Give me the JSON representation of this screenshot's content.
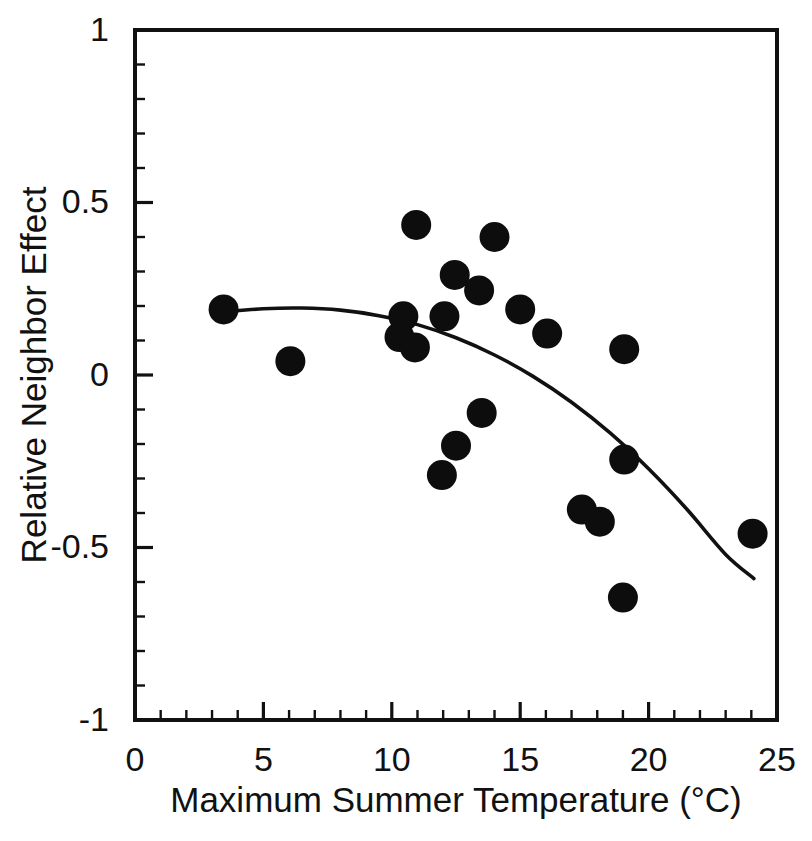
{
  "chart_data": {
    "type": "scatter",
    "title": "",
    "xlabel": "Maximum Summer Temperature (°C)",
    "ylabel": "Relative Neighbor Effect",
    "xlim": [
      0,
      25
    ],
    "ylim": [
      -1,
      1
    ],
    "grid": false,
    "legend": "none",
    "x_ticks_major": [
      0,
      5,
      10,
      15,
      20,
      25
    ],
    "x_tick_labels": [
      "0",
      "5",
      "10",
      "15",
      "20",
      "25"
    ],
    "x_tick_minor_step": 1,
    "y_ticks_major": [
      -1,
      -0.5,
      0,
      0.5,
      1
    ],
    "y_tick_labels": [
      "-1",
      "-0.5",
      "0",
      "0.5",
      "1"
    ],
    "y_tick_minor_step": 0.1,
    "marker": "filled-circle",
    "marker_color": "#0d0d0d",
    "marker_radius_px": 15,
    "points": [
      {
        "x": 3.45,
        "y": 0.19
      },
      {
        "x": 6.05,
        "y": 0.04
      },
      {
        "x": 10.45,
        "y": 0.17
      },
      {
        "x": 10.3,
        "y": 0.11
      },
      {
        "x": 10.9,
        "y": 0.08
      },
      {
        "x": 10.95,
        "y": 0.435
      },
      {
        "x": 12.05,
        "y": 0.17
      },
      {
        "x": 12.45,
        "y": 0.29
      },
      {
        "x": 13.4,
        "y": 0.245
      },
      {
        "x": 14.0,
        "y": 0.4
      },
      {
        "x": 15.0,
        "y": 0.19
      },
      {
        "x": 16.05,
        "y": 0.12
      },
      {
        "x": 19.05,
        "y": 0.075
      },
      {
        "x": 13.5,
        "y": -0.11
      },
      {
        "x": 12.5,
        "y": -0.205
      },
      {
        "x": 11.95,
        "y": -0.29
      },
      {
        "x": 19.05,
        "y": -0.245
      },
      {
        "x": 17.4,
        "y": -0.39
      },
      {
        "x": 18.1,
        "y": -0.425
      },
      {
        "x": 24.05,
        "y": -0.46
      },
      {
        "x": 19.0,
        "y": -0.645
      }
    ],
    "fit_curve": {
      "name": "quadratic-fit",
      "style": "solid",
      "color": "#111111",
      "x_start": 3.5,
      "x_end": 24.1,
      "points": [
        {
          "x": 3.5,
          "y": 0.183
        },
        {
          "x": 5.0,
          "y": 0.192
        },
        {
          "x": 6.5,
          "y": 0.194
        },
        {
          "x": 8.0,
          "y": 0.188
        },
        {
          "x": 9.5,
          "y": 0.172
        },
        {
          "x": 11.0,
          "y": 0.146
        },
        {
          "x": 12.5,
          "y": 0.108
        },
        {
          "x": 14.0,
          "y": 0.058
        },
        {
          "x": 15.5,
          "y": -0.004
        },
        {
          "x": 17.0,
          "y": -0.079
        },
        {
          "x": 18.5,
          "y": -0.168
        },
        {
          "x": 20.0,
          "y": -0.272
        },
        {
          "x": 21.5,
          "y": -0.39
        },
        {
          "x": 23.0,
          "y": -0.52
        },
        {
          "x": 24.1,
          "y": -0.59
        }
      ]
    }
  },
  "axes": {
    "x_title": "Maximum Summer Temperature (°C)",
    "y_title": "Relative Neighbor Effect",
    "x_labels": [
      "0",
      "5",
      "10",
      "15",
      "20",
      "25"
    ],
    "y_labels": [
      "1",
      "0.5",
      "0",
      "-0.5",
      "-1"
    ]
  }
}
